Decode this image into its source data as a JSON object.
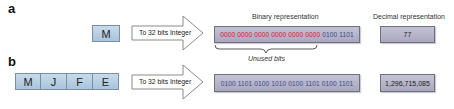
{
  "panels": {
    "a": {
      "label": "a",
      "input_chars": [
        "M"
      ],
      "arrow_label": "To 32 bits Integer",
      "binary_caption": "Binary representation",
      "decimal_caption": "Decimal representation",
      "binary_unused": "0000 0000 0000 0000 0000 0000",
      "binary_used": "0100 1101",
      "brace_label": "Unused bits",
      "decimal_value": "77"
    },
    "b": {
      "label": "b",
      "input_chars": [
        "M",
        "J",
        "F",
        "E"
      ],
      "arrow_label": "To 32 bits Integer",
      "binary_value": "0100 1101 0100 1010 0100 1101 0100 1101",
      "decimal_value": "1,296,715,085"
    }
  },
  "colors": {
    "char_box": "#b8d0e4",
    "binary_box": "#b6b4c8",
    "unused_bits": "#d02030",
    "used_bits": "#3a4c8c"
  }
}
